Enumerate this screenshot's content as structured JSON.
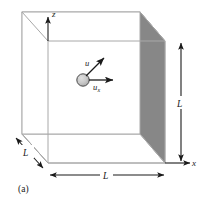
{
  "figure": {
    "caption": "(a)",
    "axes": {
      "z_label": "z",
      "x_label": "x"
    },
    "dimensions": {
      "right_vertical": "L",
      "bottom_horizontal": "L",
      "depth_diagonal": "L"
    },
    "particle": {
      "velocity_label": "u",
      "velocity_x_label": "u",
      "velocity_x_subscript": "x"
    },
    "colors": {
      "panel_fill": "#8a8a8a",
      "panel_fill_right": "#878787",
      "floor_fill": "#ffffff",
      "outline": "#a8a8a8",
      "ink": "#1a1a1a",
      "particle_fill": "#c9c9c9",
      "particle_stroke": "#4a4a4a",
      "background": "#ffffff"
    }
  }
}
